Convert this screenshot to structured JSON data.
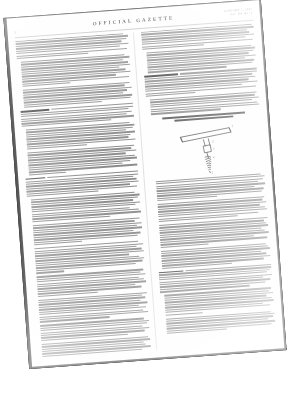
{
  "document": {
    "kind": "scanned-newspaper-page",
    "publication_title": "OFFICIAL GAZETTE",
    "page_number_left": "2",
    "header_right_line1": "JANUARY 7, 1913",
    "header_right_line2": "Vol. 186  No. 1",
    "rotation_degrees": -4.2,
    "background_color": "#ffffff",
    "paper_color": "#fefefe",
    "ink_color": "#3d3d3d",
    "border_color": "#111111"
  },
  "columns": {
    "count": 2,
    "left_label": "left-column",
    "right_label": "right-column"
  },
  "figure": {
    "caption_label": "patent-figure",
    "reference_numerals": [
      "1",
      "2",
      "3",
      "4",
      "5"
    ],
    "line_color": "#4a4a4a"
  }
}
